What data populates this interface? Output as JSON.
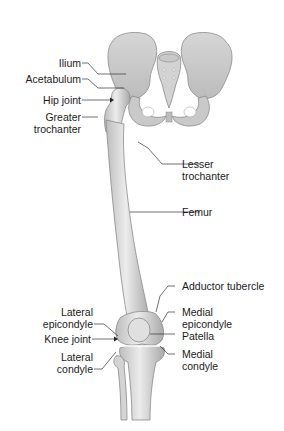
{
  "diagram": {
    "colors": {
      "bone_fill": "#e4e4e4",
      "bone_shade": "#b9b9b9",
      "bone_outline": "#8a8a8a",
      "leader_line": "#333333",
      "text": "#1a1a1a",
      "background": "#ffffff"
    },
    "labels_left": [
      {
        "id": "ilium",
        "lines": [
          "Ilium"
        ]
      },
      {
        "id": "acetabulum",
        "lines": [
          "Acetabulum"
        ]
      },
      {
        "id": "hip-joint",
        "lines": [
          "Hip joint"
        ]
      },
      {
        "id": "greater-trochanter",
        "lines": [
          "Greater",
          "trochanter"
        ]
      },
      {
        "id": "lateral-epicondyle",
        "lines": [
          "Lateral",
          "epicondyle"
        ]
      },
      {
        "id": "knee-joint",
        "lines": [
          "Knee joint"
        ]
      },
      {
        "id": "lateral-condyle",
        "lines": [
          "Lateral",
          "condyle"
        ]
      }
    ],
    "labels_right": [
      {
        "id": "lesser-trochanter",
        "lines": [
          "Lesser",
          "trochanter"
        ]
      },
      {
        "id": "femur",
        "lines": [
          "Femur"
        ]
      },
      {
        "id": "adductor-tubercle",
        "lines": [
          "Adductor tubercle"
        ]
      },
      {
        "id": "medial-epicondyle",
        "lines": [
          "Medial",
          "epicondyle"
        ]
      },
      {
        "id": "patella",
        "lines": [
          "Patella"
        ]
      },
      {
        "id": "medial-condyle",
        "lines": [
          "Medial",
          "condyle"
        ]
      }
    ]
  }
}
